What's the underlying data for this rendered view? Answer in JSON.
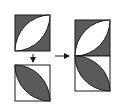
{
  "diagram": {
    "colors": {
      "dark_fill": "#5a5a5a",
      "light_fill": "#ffffff",
      "stroke": "#1a1a1a",
      "background": "#ffffff"
    },
    "tiles": [
      {
        "id": "tile-a",
        "x": 15,
        "y": 15,
        "size": 36,
        "background": "dark",
        "lens": "light",
        "lens_direction": "bottom-left-to-top-right"
      },
      {
        "id": "tile-b",
        "x": 15,
        "y": 65,
        "size": 36,
        "background": "light",
        "lens": "dark",
        "lens_direction": "top-left-to-bottom-right"
      },
      {
        "id": "tile-c-top",
        "x": 75,
        "y": 20,
        "size": 36,
        "background": "dark",
        "lens": "light",
        "lens_direction": "bottom-left-to-top-right"
      },
      {
        "id": "tile-c-bottom",
        "x": 75,
        "y": 56,
        "size": 36,
        "background": "light",
        "lens": "dark",
        "lens_direction": "top-left-to-bottom-right"
      }
    ],
    "arrows": [
      {
        "id": "arrow-down",
        "direction": "down"
      },
      {
        "id": "arrow-right",
        "direction": "right"
      }
    ]
  }
}
